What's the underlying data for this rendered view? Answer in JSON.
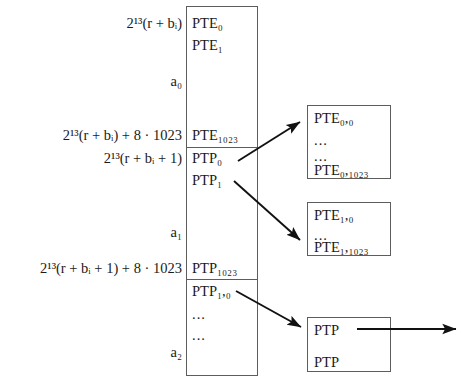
{
  "diagram": {
    "line_color": "#5d5d5d",
    "text_color": "#1a1a1a"
  },
  "address_labels": [
    {
      "id": "addr-pte0",
      "text": "2¹³(r + bᵢ)"
    },
    {
      "id": "addr-a0",
      "text": "a₀"
    },
    {
      "id": "addr-pte1023",
      "text": "2¹³(r + bᵢ) + 8 · 1023"
    },
    {
      "id": "addr-ptp0",
      "text": "2¹³(r + bᵢ + 1)"
    },
    {
      "id": "addr-a1",
      "text": "a₁"
    },
    {
      "id": "addr-ptp1023",
      "text": "2¹³(r + bᵢ + 1) + 8 · 1023"
    },
    {
      "id": "addr-a2",
      "text": "a₂"
    }
  ],
  "column": {
    "name": "memory-column",
    "cells": [
      {
        "id": "cell-pte0",
        "text": "PTE₀"
      },
      {
        "id": "cell-pte1",
        "text": "PTE₁"
      },
      {
        "id": "cell-pte1023",
        "text": "PTE₁₀₂₃"
      },
      {
        "id": "cell-ptp0",
        "text": "PTP₀"
      },
      {
        "id": "cell-ptp1",
        "text": "PTP₁"
      },
      {
        "id": "cell-ptp1023",
        "text": "PTP₁₀₂₃"
      },
      {
        "id": "cell-ptp10",
        "text": "PTP₁,₀"
      },
      {
        "id": "cell-dots-1",
        "text": "..."
      },
      {
        "id": "cell-dots-2",
        "text": "..."
      }
    ]
  },
  "target_boxes": [
    {
      "id": "box-pte0",
      "lines": [
        "PTE₀,₀",
        "...",
        "...",
        "PTE₀,₁₀₂₃"
      ]
    },
    {
      "id": "box-pte1",
      "lines": [
        "PTE₁,₀",
        "...",
        "PTE₁,₁₀₂₃"
      ]
    },
    {
      "id": "box-ptp",
      "lines": [
        "PTP",
        "PTP"
      ]
    }
  ],
  "arrows": [
    {
      "id": "arrow-ptp0-to-box-pte0",
      "from": "PTP₀",
      "to": "PTE₀,₀ table"
    },
    {
      "id": "arrow-ptp1-to-box-pte1",
      "from": "PTP₁",
      "to": "PTE₁,₀ table"
    },
    {
      "id": "arrow-ptp10-to-box-ptp",
      "from": "PTP₁,₀",
      "to": "PTP table"
    },
    {
      "id": "arrow-ptp-outgoing",
      "from": "PTP",
      "to": ""
    }
  ]
}
